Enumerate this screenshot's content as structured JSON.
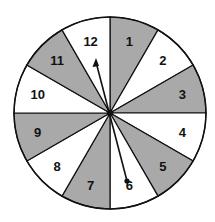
{
  "spinner": {
    "center": [
      110,
      113
    ],
    "radius": 96,
    "colors": {
      "shaded": "#a9a9a9",
      "unshaded": "#ffffff",
      "stroke": "#111111"
    },
    "sections": [
      {
        "label": "1",
        "shaded": true
      },
      {
        "label": "2",
        "shaded": false
      },
      {
        "label": "3",
        "shaded": true
      },
      {
        "label": "4",
        "shaded": false
      },
      {
        "label": "5",
        "shaded": true
      },
      {
        "label": "6",
        "shaded": false
      },
      {
        "label": "7",
        "shaded": true
      },
      {
        "label": "8",
        "shaded": false
      },
      {
        "label": "9",
        "shaded": true
      },
      {
        "label": "10",
        "shaded": false
      },
      {
        "label": "11",
        "shaded": true
      },
      {
        "label": "12",
        "shaded": false
      }
    ],
    "arrow": {
      "tip_section": "12",
      "tail_section": "6"
    }
  }
}
